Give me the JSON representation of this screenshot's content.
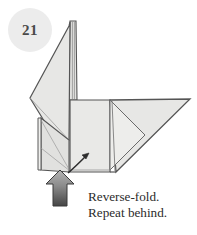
{
  "document": {
    "type": "origami-instruction-diagram",
    "background_color": "#ffffff"
  },
  "step": {
    "number": "21",
    "badge_fill": "#ececec",
    "badge_text_color": "#4a4a4a"
  },
  "caption": {
    "line1": "Reverse-fold.",
    "line2": "Repeat behind.",
    "text_color": "#2b2b2b"
  },
  "figure": {
    "name": "folded-paper-bird-model",
    "paper_fill": "#e7e7e5",
    "paper_fill_shadow": "#dcdcda",
    "paper_fill_light": "#f1f1ef",
    "outline_color": "#555555",
    "crease_color": "#8c8c8c",
    "parts": [
      {
        "name": "neck-and-head",
        "description": "tall vertical spike at top center"
      },
      {
        "name": "left-wing",
        "description": "large angled flap pointing left"
      },
      {
        "name": "body",
        "description": "central rectangular panel"
      },
      {
        "name": "tail",
        "description": "triangular flap extending to the right"
      },
      {
        "name": "leg-flap",
        "description": "narrow vertical flap at lower left"
      }
    ]
  },
  "arrows": {
    "push_arrow": {
      "name": "push-arrow",
      "direction": "up",
      "fill_top": "#a8a8a8",
      "fill_bottom": "#4d4d4d",
      "outline": "#3a3a3a"
    },
    "fold_arrow": {
      "name": "reverse-fold-arrow",
      "direction": "up-right",
      "color": "#2d2d2d"
    }
  }
}
